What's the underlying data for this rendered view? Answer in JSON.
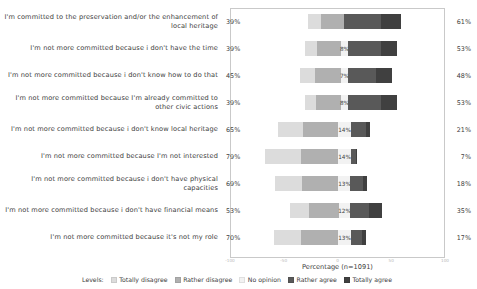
{
  "chart_data": {
    "type": "bar",
    "subtype": "diverging-stacked-likert",
    "title": "",
    "xlabel": "Percentage (n=1091)",
    "ylabel": "",
    "xlim": [
      -100,
      100
    ],
    "xticks": [
      "-100",
      "-50",
      "0",
      "50",
      "100"
    ],
    "grid": false,
    "legend_position": "bottom",
    "legend_title": "Levels:",
    "legend": [
      "Totally disagree",
      "Rather disagree",
      "No opinion",
      "Rather agree",
      "Totally agree"
    ],
    "colors": {
      "totally_disagree": "#dcdcdc",
      "rather_disagree": "#b0b0b0",
      "no_opinion": "#f2f2f2",
      "rather_agree": "#595959",
      "totally_agree": "#404040",
      "frame": "#c9c9c9",
      "text": "#3d3d3d"
    },
    "categories": [
      "I'm committed to the preservation and/or the enhancement of local heritage",
      "I'm not more committed because i don't have the time",
      "I'm not more committed because i don't know how to do that",
      "I'm not more committed because I'm already committed to other civic actions",
      "I'm not more committed because i don't know local heritage",
      "I'm not more committed because I'm not interested",
      "I'm not more committed because i don't have physical capacities",
      "I'm not more committed because i don't have financial means",
      "I'm not more committed because it's not my role"
    ],
    "series": [
      {
        "name": "Totally disagree",
        "values": [
          14,
          13,
          17,
          12,
          27,
          39,
          30,
          21,
          30
        ]
      },
      {
        "name": "Rather disagree",
        "values": [
          25,
          26,
          28,
          27,
          38,
          40,
          39,
          32,
          40
        ]
      },
      {
        "name": "No opinion",
        "values": [
          0,
          8,
          7,
          8,
          14,
          14,
          13,
          12,
          13
        ]
      },
      {
        "name": "Rather agree",
        "values": [
          39,
          36,
          31,
          35,
          16,
          5,
          13,
          21,
          12
        ]
      },
      {
        "name": "Totally agree",
        "values": [
          22,
          17,
          17,
          18,
          5,
          2,
          5,
          14,
          5
        ]
      }
    ],
    "rows": [
      {
        "label": "I'm committed to the preservation and/or the enhancement of local heritage",
        "disagree_total": "39%",
        "agree_total": "61%",
        "no_opinion_label": "",
        "totally_disagree": 14,
        "rather_disagree": 25,
        "no_opinion": 0,
        "rather_agree": 39,
        "totally_agree": 22
      },
      {
        "label": "I'm not more committed because i don't have the time",
        "disagree_total": "39%",
        "agree_total": "53%",
        "no_opinion_label": "8%",
        "totally_disagree": 13,
        "rather_disagree": 26,
        "no_opinion": 8,
        "rather_agree": 36,
        "totally_agree": 17
      },
      {
        "label": "I'm not more committed because i don't know how to do that",
        "disagree_total": "45%",
        "agree_total": "48%",
        "no_opinion_label": "7%",
        "totally_disagree": 17,
        "rather_disagree": 28,
        "no_opinion": 7,
        "rather_agree": 31,
        "totally_agree": 17
      },
      {
        "label": "I'm not more committed because I'm already committed to other civic actions",
        "disagree_total": "39%",
        "agree_total": "53%",
        "no_opinion_label": "8%",
        "totally_disagree": 12,
        "rather_disagree": 27,
        "no_opinion": 8,
        "rather_agree": 35,
        "totally_agree": 18
      },
      {
        "label": "I'm not more committed because i don't know local heritage",
        "disagree_total": "65%",
        "agree_total": "21%",
        "no_opinion_label": "14%",
        "totally_disagree": 27,
        "rather_disagree": 38,
        "no_opinion": 14,
        "rather_agree": 16,
        "totally_agree": 5
      },
      {
        "label": "I'm not more committed because I'm not interested",
        "disagree_total": "79%",
        "agree_total": "7%",
        "no_opinion_label": "14%",
        "totally_disagree": 39,
        "rather_disagree": 40,
        "no_opinion": 14,
        "rather_agree": 5,
        "totally_agree": 2
      },
      {
        "label": "I'm not more committed because i don't have physical capacities",
        "disagree_total": "69%",
        "agree_total": "18%",
        "no_opinion_label": "13%",
        "totally_disagree": 30,
        "rather_disagree": 39,
        "no_opinion": 13,
        "rather_agree": 13,
        "totally_agree": 5
      },
      {
        "label": "I'm not more committed because i don't have financial means",
        "disagree_total": "53%",
        "agree_total": "35%",
        "no_opinion_label": "12%",
        "totally_disagree": 21,
        "rather_disagree": 32,
        "no_opinion": 12,
        "rather_agree": 21,
        "totally_agree": 14
      },
      {
        "label": "I'm not more committed because it's not my role",
        "disagree_total": "70%",
        "agree_total": "17%",
        "no_opinion_label": "13%",
        "totally_disagree": 30,
        "rather_disagree": 40,
        "no_opinion": 13,
        "rather_agree": 12,
        "totally_agree": 5
      }
    ]
  }
}
